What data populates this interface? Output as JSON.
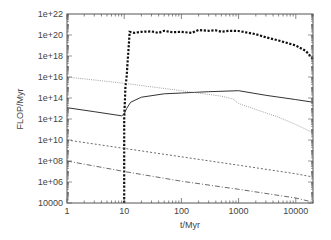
{
  "chart_data": {
    "type": "line",
    "title": "",
    "xlabel": "t/Myr",
    "ylabel": "FLOP/Myr",
    "xscale": "log",
    "yscale": "log",
    "xlim": [
      1,
      20000
    ],
    "ylim": [
      10000,
      1e+22
    ],
    "grid": false,
    "legend": null,
    "x_ticks": [
      1,
      10,
      100,
      1000,
      10000
    ],
    "x_tick_labels": [
      "1",
      "10",
      "100",
      "1000",
      "10000"
    ],
    "y_ticks": [
      10000,
      1000000.0,
      100000000.0,
      10000000000.0,
      1000000000000.0,
      100000000000000.0,
      1e+16,
      1e+18,
      1e+20,
      1e+22
    ],
    "y_tick_labels": [
      "10000",
      "1e+06",
      "1e+08",
      "1e+10",
      "1e+12",
      "1e+14",
      "1e+16",
      "1e+18",
      "1e+20",
      "1e+22"
    ],
    "series": [
      {
        "name": "thick-dashed",
        "style": "thick-dotted",
        "color": "#111111",
        "x": [
          10,
          10,
          10.5,
          11,
          12.5,
          15,
          20,
          30,
          40,
          50,
          70,
          100,
          150,
          200,
          300,
          400,
          500,
          700,
          1000,
          2000,
          3000,
          5000,
          10000,
          15000,
          20000
        ],
        "y": [
          10000,
          1000000000000.0,
          1000000000000000.0,
          1e+16,
          2e+20,
          1.6e+20,
          2e+20,
          2.2e+20,
          1.6e+20,
          2.5e+20,
          1.8e+20,
          2e+20,
          1.6e+20,
          3e+20,
          2.5e+20,
          2.8e+20,
          2e+20,
          2.5e+20,
          2.4e+20,
          1.2e+20,
          6e+19,
          3e+19,
          1e+19,
          3e+18,
          5e+17
        ]
      },
      {
        "name": "solid",
        "style": "solid",
        "color": "#333333",
        "x": [
          1,
          3,
          9,
          10,
          11,
          13,
          20,
          50,
          100,
          300,
          1000,
          3000,
          10000,
          20000
        ],
        "y": [
          12000000000000.0,
          5000000000000.0,
          2000000000000.0,
          3000000000000.0,
          10000000000000.0,
          40000000000000.0,
          120000000000000.0,
          250000000000000.0,
          300000000000000.0,
          400000000000000.0,
          500000000000000.0,
          180000000000000.0,
          70000000000000.0,
          40000000000000.0
        ]
      },
      {
        "name": "gray-dotted",
        "style": "dotted",
        "color": "#888888",
        "x": [
          1,
          10,
          100,
          500,
          800,
          1000,
          2000,
          5000,
          10000,
          20000
        ],
        "y": [
          1e+16,
          2500000000000000.0,
          500000000000000.0,
          150000000000000.0,
          80000000000000.0,
          30000000000000.0,
          8000000000000.0,
          1500000000000.0,
          300000000000.0,
          50000000000.0
        ]
      },
      {
        "name": "fine-dashed",
        "style": "dashed",
        "color": "#444444",
        "x": [
          1,
          10,
          100,
          1000,
          10000,
          20000
        ],
        "y": [
          10000000000.0,
          1600000000.0,
          250000000.0,
          40000000.0,
          6000000.0,
          3000000.0
        ]
      },
      {
        "name": "dash-dot",
        "style": "dash-dot",
        "color": "#444444",
        "x": [
          1,
          10,
          100,
          1000,
          10000,
          20000
        ],
        "y": [
          100000000.0,
          10000000.0,
          1200000.0,
          200000.0,
          30000.0,
          12000
        ]
      }
    ]
  }
}
